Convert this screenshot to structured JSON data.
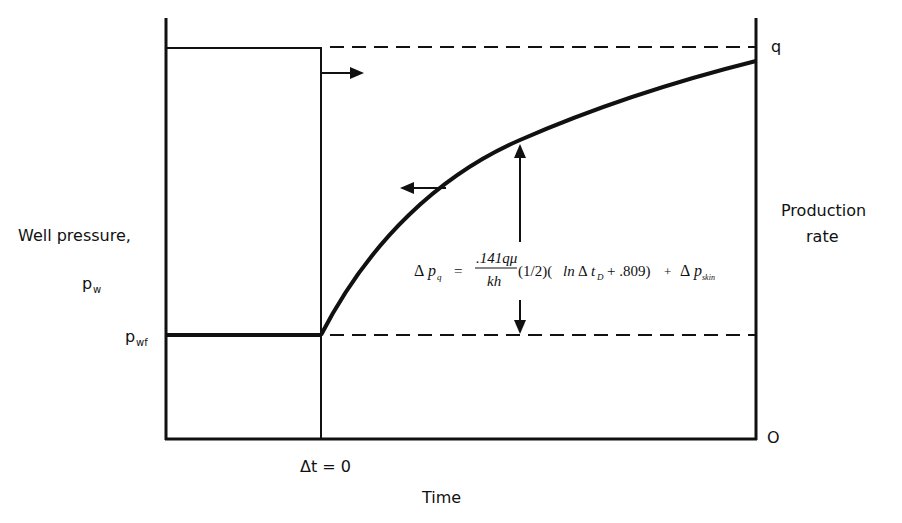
{
  "diagram": {
    "left_axis": {
      "title": "Well pressure,",
      "symbol_main": "p",
      "symbol_sub": "w",
      "level_symbol_main": "p",
      "level_symbol_sub": "wf"
    },
    "right_axis": {
      "title_line1": "Production",
      "title_line2": "rate",
      "top_label": "q",
      "bottom_label": "O"
    },
    "x_axis": {
      "title": "Time",
      "marker_label": "Δt = 0"
    },
    "equation": {
      "lhs_delta": "Δ",
      "lhs_p": "p",
      "lhs_sub": "q",
      "equals": "=",
      "numerator": ".141qμ",
      "denominator": "kh",
      "factor": "(1/2)(",
      "ln": "ln",
      "delta": "Δ",
      "t": "t",
      "t_sub": "D",
      "tail": "+ .809)",
      "plus": "+",
      "skin_delta": "Δ",
      "skin_p": "p",
      "skin_sub": "skin"
    },
    "arrows": {
      "rate_direction": "right-arrow",
      "pressure_direction": "left-arrow",
      "delta_p_indicator": "double-vertical-arrow"
    },
    "colors": {
      "ink": "#111111",
      "background": "#ffffff"
    }
  }
}
